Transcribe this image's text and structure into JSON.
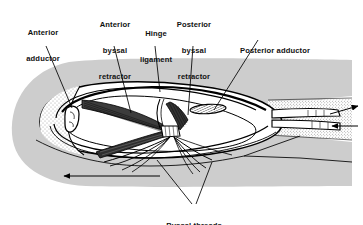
{
  "figure": {
    "kind": "anatomical-diagram",
    "orientation": "Anterior at left, posterior (siphons) at right",
    "background_color": "#ffffff",
    "ink_color": "#000000",
    "sediment_color": "#cccccc",
    "shell_fill": "#ffffff",
    "stipple_color": "#555555"
  },
  "labels": {
    "anterior_adductor": {
      "line1": "Anterior",
      "line2": "adductor"
    },
    "anterior_byssal_retractor": {
      "line1": "Anterior",
      "line2": "byssal",
      "line3": "retractor"
    },
    "hinge_ligament": {
      "line1": "Hinge",
      "line2": "ligament"
    },
    "posterior_byssal_retractor": {
      "line1": "Posterior",
      "line2": "byssal",
      "line3": "retractor"
    },
    "posterior_adductor": {
      "line1": "Posterior adductor"
    },
    "byssal_threads": {
      "line1": "Byssal threads"
    }
  },
  "structures": [
    {
      "name": "sediment-burrow",
      "description": "Grey stippled sediment surrounding the animal"
    },
    {
      "name": "shell-valve",
      "description": "Elongate shell outline, anterior end rounded at left"
    },
    {
      "name": "anterior-adductor-muscle",
      "description": "Small bean-shaped muscle near anterior end"
    },
    {
      "name": "posterior-adductor-muscle",
      "description": "Hatched elongate oval muscle at posterior"
    },
    {
      "name": "anterior-byssal-retractor-muscle",
      "description": "Broad striated muscle band running antero-ventrally"
    },
    {
      "name": "posterior-byssal-retractor-muscle",
      "description": "Striated muscle band near hinge, posterior"
    },
    {
      "name": "hinge-ligament",
      "description": "Dorsal hinge along upper shell margin"
    },
    {
      "name": "byssus-stem",
      "description": "Small byssal stem emerging ventrally"
    },
    {
      "name": "byssal-threads",
      "description": "Fan of threads anchoring the animal into the sediment"
    },
    {
      "name": "exhalant-siphon",
      "description": "Upper posterior siphon, flow outward"
    },
    {
      "name": "inhalant-siphon",
      "description": "Lower posterior siphon, flow inward"
    }
  ],
  "flow_arrows": [
    {
      "name": "exhalant-flow-arrow",
      "direction": "right",
      "meaning": "water leaving exhalant siphon"
    },
    {
      "name": "inhalant-flow-arrow",
      "direction": "left",
      "meaning": "water entering inhalant siphon"
    },
    {
      "name": "burrow-current-arrow",
      "direction": "left",
      "meaning": "direction of movement / current along burrow floor"
    }
  ]
}
